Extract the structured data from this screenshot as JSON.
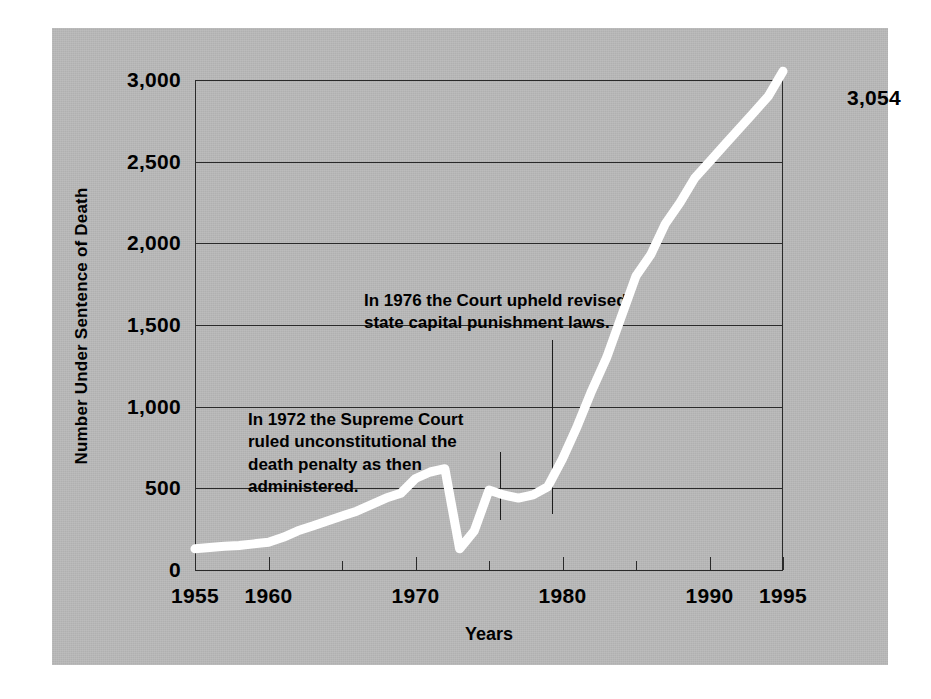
{
  "chart_data": {
    "type": "line",
    "title": "",
    "xlabel": "Years",
    "ylabel": "Number Under Sentence of Death",
    "xlim": [
      1955,
      1995
    ],
    "ylim": [
      0,
      3000
    ],
    "grid": true,
    "legend": "none",
    "line_color": "#ffffff",
    "panel_color": "#b8b8b8",
    "axis_color": "#2a2a2a",
    "y_ticks": [
      0,
      500,
      1000,
      1500,
      2000,
      2500,
      3000
    ],
    "y_tick_labels": [
      "0",
      "500",
      "1,000",
      "1,500",
      "2,000",
      "2,500",
      "3,000"
    ],
    "x_ticks": [
      1955,
      1960,
      1965,
      1970,
      1975,
      1980,
      1985,
      1990,
      1995
    ],
    "x_tick_labels": [
      "1955",
      "1960",
      "",
      "1970",
      "",
      "1980",
      "",
      "1990",
      "1995"
    ],
    "end_value_label": "3,054",
    "x": [
      1955,
      1956,
      1957,
      1958,
      1959,
      1960,
      1961,
      1962,
      1963,
      1964,
      1965,
      1966,
      1967,
      1968,
      1969,
      1970,
      1971,
      1972,
      1973,
      1974,
      1975,
      1976,
      1977,
      1978,
      1979,
      1980,
      1981,
      1982,
      1983,
      1984,
      1985,
      1986,
      1987,
      1988,
      1989,
      1990,
      1991,
      1992,
      1993,
      1994,
      1995
    ],
    "values": [
      130,
      138,
      145,
      150,
      160,
      170,
      200,
      240,
      270,
      300,
      330,
      360,
      400,
      440,
      470,
      560,
      600,
      620,
      130,
      240,
      490,
      460,
      440,
      460,
      510,
      680,
      880,
      1100,
      1300,
      1550,
      1800,
      1930,
      2120,
      2250,
      2400,
      2500,
      2600,
      2700,
      2800,
      2900,
      3054
    ]
  },
  "axis": {
    "x_title": "Years",
    "y_title": "Number Under Sentence of Death"
  },
  "annotations": [
    {
      "id": "annotation-1976",
      "text": "In 1976 the Court upheld revised\nstate capital punishment laws.",
      "year": 1976
    },
    {
      "id": "annotation-1972",
      "text": "In 1972 the Supreme Court\nruled unconstitutional the\ndeath penalty as then\nadministered.",
      "year": 1972
    }
  ]
}
